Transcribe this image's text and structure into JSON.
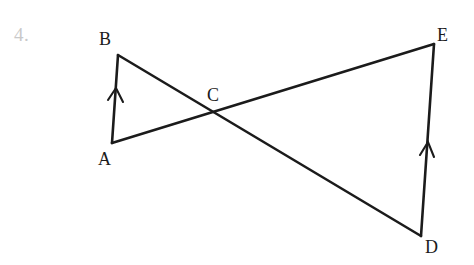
{
  "figure": {
    "problem_number": "4.",
    "background_color": "#ffffff",
    "stroke_color": "#1b1b1b",
    "number_color": "#c9c9c9",
    "width": 474,
    "height": 265
  },
  "labels": {
    "A": "A",
    "B": "B",
    "C": "C",
    "D": "D",
    "E": "E"
  },
  "geometry": {
    "points": {
      "A": {
        "x": 112,
        "y": 143
      },
      "B": {
        "x": 118,
        "y": 55
      },
      "C": {
        "x": 218,
        "y": 115
      },
      "D": {
        "x": 421,
        "y": 236
      },
      "E": {
        "x": 434,
        "y": 44
      }
    },
    "segments": [
      {
        "name": "AB",
        "from": "A",
        "to": "B",
        "tick": "single-arrow-up"
      },
      {
        "name": "BD",
        "from": "B",
        "to": "D",
        "tick": "none"
      },
      {
        "name": "AE",
        "from": "A",
        "to": "E",
        "tick": "none"
      },
      {
        "name": "DE",
        "from": "D",
        "to": "E",
        "tick": "single-arrow-up"
      }
    ],
    "intersection": {
      "name": "C",
      "of": [
        "BD",
        "AE"
      ]
    },
    "parallel_marks": [
      {
        "segment": "AB",
        "x": 116,
        "y": 99,
        "direction": "up"
      },
      {
        "segment": "DE",
        "x": 427,
        "y": 152,
        "direction": "up"
      }
    ]
  }
}
